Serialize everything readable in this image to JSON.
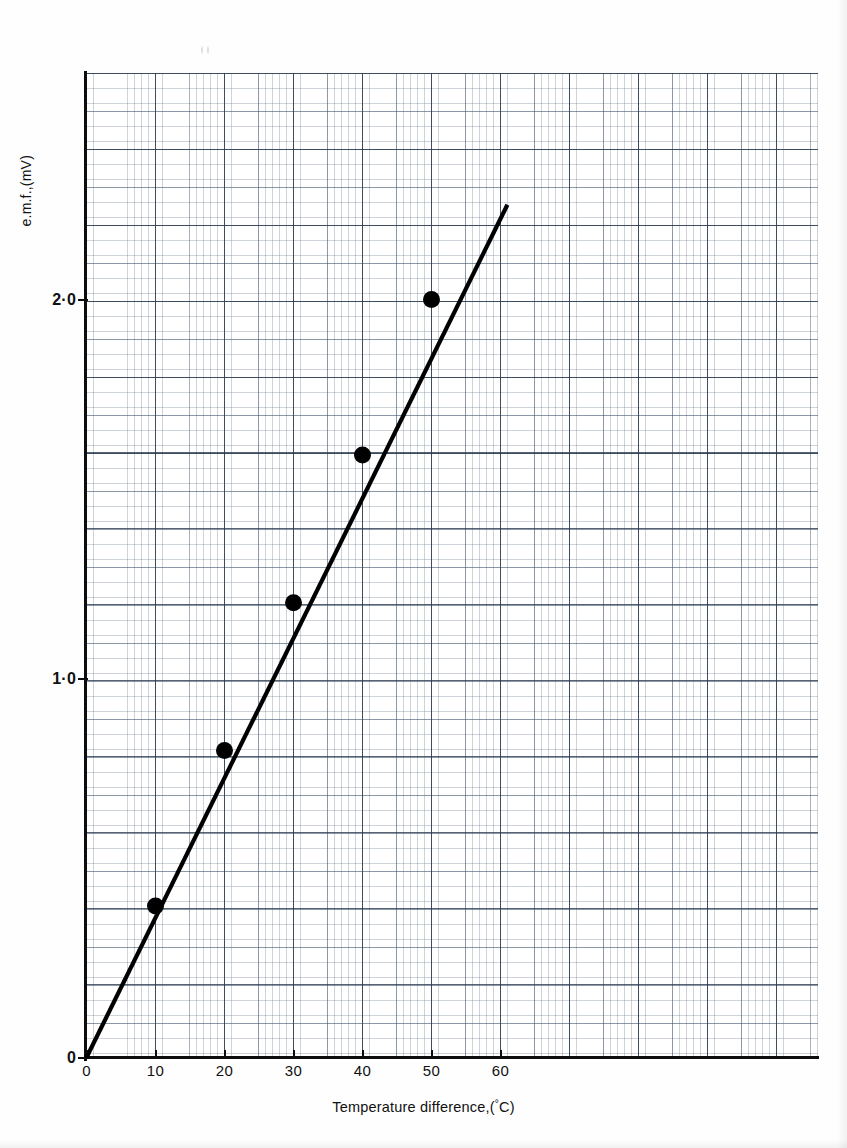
{
  "chart_data": {
    "type": "line",
    "title": "",
    "subtitle": "",
    "xlabel": "Temperature difference,(°C)",
    "ylabel": "e.m.f.,(mV)",
    "xlim": [
      0,
      106
    ],
    "ylim": [
      0,
      2.6
    ],
    "xticks": [
      0,
      10,
      20,
      30,
      40,
      50,
      60
    ],
    "xtick_labels": [
      "0",
      "10",
      "20",
      "30",
      "40",
      "50",
      "60"
    ],
    "yticks": [
      0,
      1.0,
      2.0
    ],
    "ytick_labels": [
      "0",
      "1·0",
      "2·0"
    ],
    "grid": true,
    "grid_style": "graph-paper, major cells 10 °C by 0.2 mV with fine 1/10 subdivisions",
    "legend": "none",
    "series": [
      {
        "name": "e.m.f. against temperature difference",
        "marker": "filled-circle",
        "line_style": "solid",
        "line_color": "#000000",
        "x": [
          10,
          20,
          30,
          40,
          50
        ],
        "y": [
          0.4,
          0.81,
          1.2,
          1.59,
          2.0
        ]
      }
    ],
    "fit_line": {
      "description": "best-fit straight line through the origin",
      "x_start": 0,
      "y_start": 0,
      "x_end": 61,
      "y_end": 2.25,
      "slope_mV_per_degC": 0.04
    },
    "annotations": []
  },
  "axes": {
    "y_title": "e.m.f.,(mV)",
    "x_title_prefix": "Temperature difference,(",
    "x_title_degree": "°",
    "x_title_suffix": "C)"
  }
}
